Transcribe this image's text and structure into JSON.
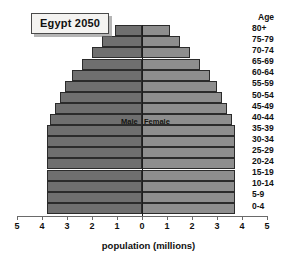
{
  "chart_data": {
    "type": "bar",
    "subtype": "population-pyramid",
    "title": "Egypt 2050",
    "xlabel": "population (millions)",
    "ylabel": "Age",
    "categories": [
      "0-4",
      "5-9",
      "10-14",
      "15-19",
      "20-24",
      "25-29",
      "30-34",
      "35-39",
      "40-44",
      "45-49",
      "50-54",
      "55-59",
      "60-64",
      "65-69",
      "70-74",
      "75-79",
      "80+"
    ],
    "series": [
      {
        "name": "Male",
        "values": [
          3.8,
          3.8,
          3.8,
          3.8,
          3.8,
          3.8,
          3.8,
          3.8,
          3.7,
          3.5,
          3.3,
          3.1,
          2.8,
          2.4,
          2.0,
          1.6,
          1.1
        ]
      },
      {
        "name": "Female",
        "values": [
          3.7,
          3.7,
          3.7,
          3.7,
          3.7,
          3.7,
          3.7,
          3.7,
          3.6,
          3.4,
          3.2,
          3.0,
          2.7,
          2.3,
          1.9,
          1.5,
          1.1
        ]
      }
    ],
    "xtick_labels": [
      "5",
      "4",
      "3",
      "2",
      "1",
      "0",
      "1",
      "2",
      "3",
      "4",
      "5"
    ],
    "xlim": [
      -5,
      5
    ],
    "grid": false,
    "legend_position": "inline-center",
    "colors": {
      "male": "#6f6f6f",
      "female": "#8e8e8e",
      "axis": "#6a6a6a",
      "text": "#111111"
    }
  },
  "labels": {
    "age_header": "Age",
    "male": "Male",
    "female": "Female"
  }
}
